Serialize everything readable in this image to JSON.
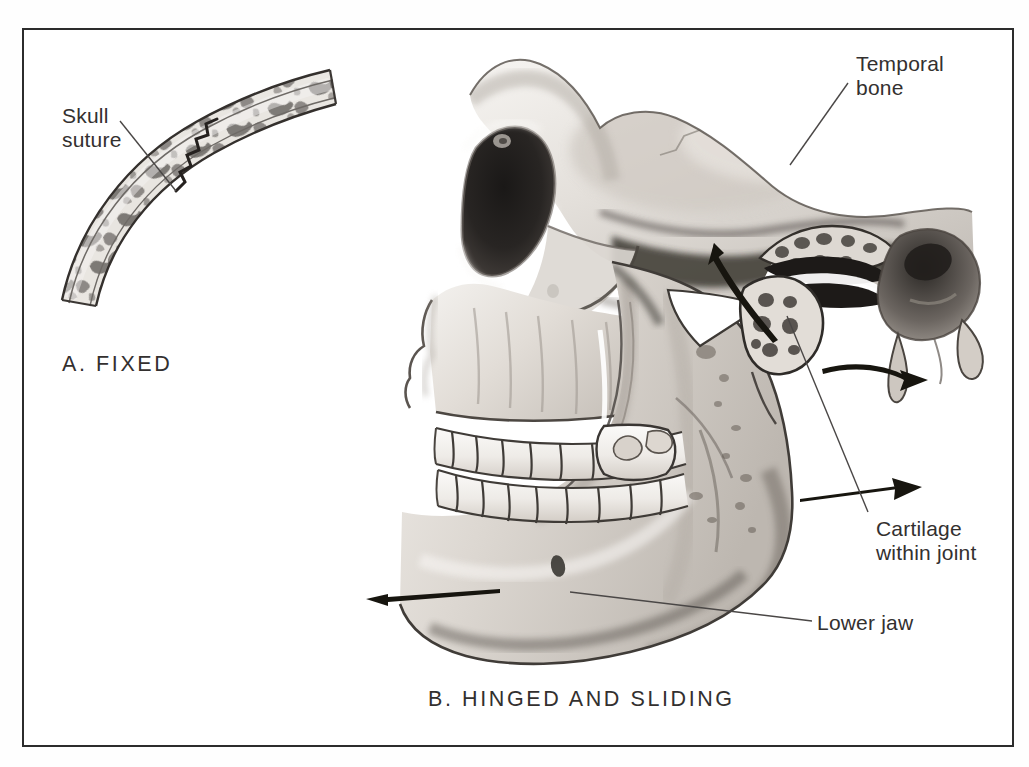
{
  "figure": {
    "title_visible": false,
    "background_color": "#ffffff",
    "border_color": "#2c2c2c",
    "ink_color": "#33302f",
    "leader_line_color": "#4a4746"
  },
  "panel_a": {
    "caption": "A.  FIXED",
    "label": "Skull\nsuture",
    "subject": "curved section of skull bone showing a fixed suture joint",
    "leader": {
      "from": [
        120,
        121
      ],
      "to": [
        176,
        191
      ]
    }
  },
  "panel_b": {
    "caption": "B.  HINGED  AND  SLIDING",
    "subject": "lateral view of skull and mandible showing the temporomandibular joint",
    "labels": [
      {
        "name": "temporal-bone",
        "text": "Temporal\nbone",
        "x": 856,
        "y": 52,
        "leader": {
          "from": [
            848,
            83
          ],
          "to": [
            790,
            165
          ]
        }
      },
      {
        "name": "cartilage-within-joint",
        "text": "Cartilage\nwithin joint",
        "x": 876,
        "y": 517,
        "leader": {
          "from": [
            868,
            512
          ],
          "to": [
            787,
            316
          ]
        }
      },
      {
        "name": "lower-jaw",
        "text": "Lower jaw",
        "x": 817,
        "y": 611,
        "leader": {
          "from": [
            812,
            621
          ],
          "to": [
            570,
            592
          ]
        }
      }
    ],
    "motion_arrows": [
      {
        "name": "chin-protrusion-arrow",
        "direction": "left",
        "from": [
          500,
          590
        ],
        "to": [
          366,
          599
        ]
      },
      {
        "name": "condyle-rotation-arrow",
        "direction": "up-left curved",
        "from": [
          775,
          338
        ],
        "to": [
          714,
          243
        ]
      },
      {
        "name": "ramus-slide-arrow",
        "direction": "right curved",
        "from": [
          822,
          371
        ],
        "to": [
          925,
          383
        ]
      },
      {
        "name": "jaw-slide-arrow",
        "direction": "right",
        "from": [
          800,
          500
        ],
        "to": [
          925,
          487
        ]
      }
    ]
  },
  "icon_names": {
    "arrow": "arrow-icon",
    "leader": "leader-line-icon"
  }
}
